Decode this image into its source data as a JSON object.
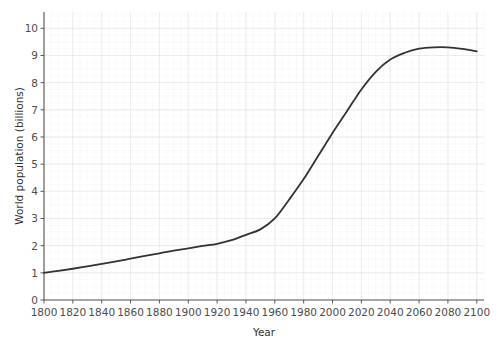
{
  "chart_data": {
    "type": "line",
    "title": "",
    "xlabel": "Year",
    "ylabel": "World population (billions)",
    "xlim": [
      1800,
      2105
    ],
    "ylim": [
      0,
      10.6
    ],
    "xticks": [
      1800,
      1820,
      1840,
      1860,
      1880,
      1900,
      1920,
      1940,
      1960,
      1980,
      2000,
      2020,
      2040,
      2060,
      2080,
      2100
    ],
    "xtick_labels": [
      "1800",
      "1820",
      "1840",
      "1860",
      "1880",
      "1900",
      "1920",
      "1940",
      "1960",
      "1980",
      "2000",
      "2020",
      "2040",
      "2060",
      "2080",
      "2100"
    ],
    "yticks": [
      0,
      1,
      2,
      3,
      4,
      5,
      6,
      7,
      8,
      9,
      10
    ],
    "ytick_labels": [
      "0",
      "1",
      "2",
      "3",
      "4",
      "5",
      "6",
      "7",
      "8",
      "9",
      "10"
    ],
    "grid": true,
    "grid_minor": true,
    "legend": false,
    "legend_position": "none",
    "line_color": "#333333",
    "line_width": 1.8,
    "grid_color": "#ececf2",
    "axis_color": "#595959",
    "background": "#ffffff",
    "series": [
      {
        "name": "World population",
        "x": [
          1800,
          1810,
          1820,
          1830,
          1840,
          1850,
          1860,
          1870,
          1880,
          1890,
          1900,
          1910,
          1920,
          1930,
          1940,
          1950,
          1960,
          1970,
          1980,
          1990,
          2000,
          2010,
          2020,
          2030,
          2040,
          2050,
          2060,
          2070,
          2080,
          2090,
          2100
        ],
        "values": [
          1.0,
          1.07,
          1.15,
          1.24,
          1.33,
          1.42,
          1.52,
          1.62,
          1.72,
          1.82,
          1.9,
          1.99,
          2.07,
          2.2,
          2.4,
          2.6,
          3.0,
          3.7,
          4.45,
          5.3,
          6.15,
          6.95,
          7.75,
          8.4,
          8.85,
          9.1,
          9.25,
          9.3,
          9.3,
          9.24,
          9.15
        ]
      }
    ]
  },
  "layout": {
    "plot_left": 44,
    "plot_right": 484,
    "plot_top": 12,
    "plot_bottom": 300
  }
}
